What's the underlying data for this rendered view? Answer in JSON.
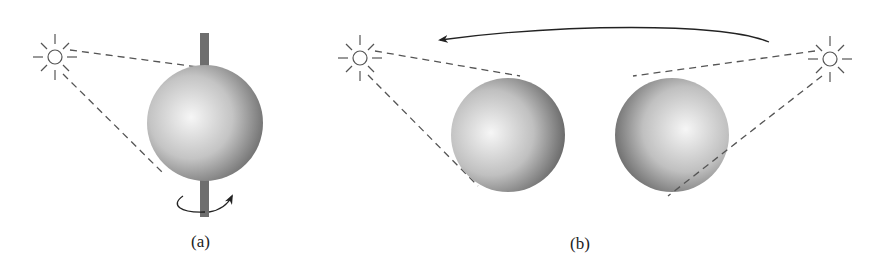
{
  "figure": {
    "panel_a": {
      "label": "(a)",
      "description": "Sphere rotating on vertical axis, illuminated by a fixed light source"
    },
    "panel_b": {
      "label": "(b)",
      "description": "Sphere lit from a light source that moves from right to left"
    },
    "icons": [
      "sun-icon",
      "rotation-arrow-icon",
      "motion-arc-arrow-icon"
    ],
    "colors": {
      "line": "#555555",
      "rod": "#6e6e6e",
      "sphere_light": "#f4f4f4",
      "sphere_dark": "#6a6a6a"
    }
  }
}
